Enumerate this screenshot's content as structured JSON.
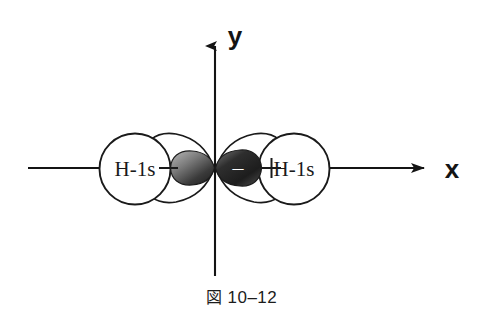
{
  "figure": {
    "caption_marker": "図",
    "caption_number": "10–12",
    "axes": {
      "x_label": "x",
      "y_label": "y"
    },
    "left_orbital": {
      "label": "H-1s",
      "sign": "–"
    },
    "right_orbital": {
      "label": "H-1s",
      "sign": "+"
    },
    "center_lobes": {
      "left_sign": "",
      "right_sign": "–"
    },
    "colors": {
      "stroke": "#1a1a1a",
      "lobe_dark": "#2a2a2a",
      "lobe_light": "#cfcfcf",
      "background": "#ffffff",
      "text": "#141414"
    }
  }
}
